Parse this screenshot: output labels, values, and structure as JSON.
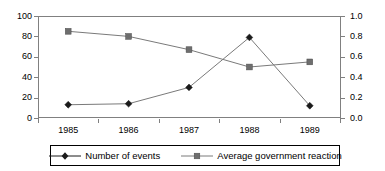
{
  "chart_data": {
    "type": "line",
    "title": "",
    "subtitle": "",
    "xlabel": "",
    "ylabel": "",
    "y2label": "",
    "categories": [
      "1985",
      "1986",
      "1987",
      "1988",
      "1989"
    ],
    "grid": false,
    "legend_position": "bottom",
    "axes": {
      "left": {
        "ylim": [
          0,
          100
        ],
        "tick_step": 20,
        "ticks": [
          0,
          20,
          40,
          60,
          80,
          100
        ],
        "tick_labels": [
          "0",
          "20",
          "40",
          "60",
          "80",
          "100"
        ]
      },
      "right": {
        "ylim": [
          0.0,
          1.0
        ],
        "tick_step": 0.2,
        "ticks": [
          0.0,
          0.2,
          0.4,
          0.6,
          0.8,
          1.0
        ],
        "tick_labels": [
          "0.0",
          "0.2",
          "0.4",
          "0.6",
          "0.8",
          "1.0"
        ]
      }
    },
    "series": [
      {
        "name": "Number of events",
        "axis": "left",
        "marker": "diamond",
        "color": "#1a1a1a",
        "values": [
          13,
          14,
          30,
          79,
          12
        ]
      },
      {
        "name": "Average government reaction",
        "axis": "right",
        "marker": "square",
        "color": "#6e6e6e",
        "values": [
          0.85,
          0.8,
          0.67,
          0.5,
          0.55
        ]
      }
    ]
  },
  "legend": {
    "entries": [
      {
        "label": "Number of events",
        "marker": "diamond-marker-icon"
      },
      {
        "label": "Average government reaction",
        "marker": "square-marker-icon"
      }
    ]
  }
}
